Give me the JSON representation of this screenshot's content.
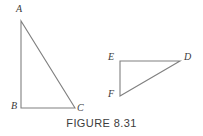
{
  "figure": {
    "caption": "FIGURE 8.31",
    "stroke_color": "#808080",
    "label_color": "#3a3a3a",
    "caption_color": "#3c3c3c",
    "background_color": "#ffffff",
    "stroke_width": 1.1,
    "width": 203,
    "height": 136
  },
  "triangles": [
    {
      "name": "triangle-abc",
      "vertices": [
        {
          "label": "A",
          "x": 21,
          "y": 21
        },
        {
          "label": "B",
          "x": 21,
          "y": 108
        },
        {
          "label": "C",
          "x": 75,
          "y": 108
        }
      ],
      "right_angle_at": "B",
      "polygon_points": "21,21 21,108 75,108"
    },
    {
      "name": "triangle-def",
      "vertices": [
        {
          "label": "E",
          "x": 120,
          "y": 61
        },
        {
          "label": "D",
          "x": 180,
          "y": 61
        },
        {
          "label": "F",
          "x": 120,
          "y": 96
        }
      ],
      "right_angle_at": "E",
      "polygon_points": "120,61 180,61 120,96"
    }
  ],
  "labels": {
    "a": "A",
    "b": "B",
    "c": "C",
    "d": "D",
    "e": "E",
    "f": "F"
  }
}
